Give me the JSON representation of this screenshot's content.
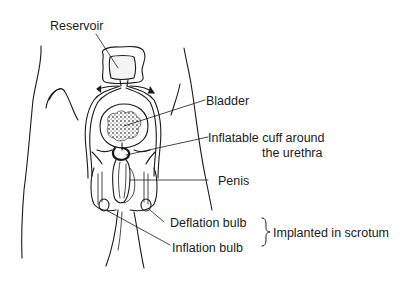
{
  "diagram": {
    "type": "anatomical-illustration",
    "colors": {
      "ink": "#1a1a1a",
      "background": "#ffffff",
      "stipple": "#6b6b6b"
    }
  },
  "labels": {
    "reservoir": "Reservoir",
    "bladder": "Bladder",
    "cuff_line1": "Inflatable cuff around",
    "cuff_line2": "the urethra",
    "penis": "Penis",
    "deflation_bulb": "Deflation bulb",
    "inflation_bulb": "Inflation bulb",
    "implanted": "Implanted in scrotum"
  }
}
